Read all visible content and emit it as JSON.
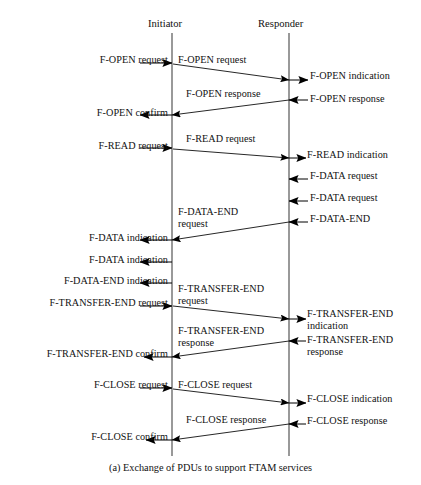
{
  "figure": {
    "caption": "(a) Exchange of PDUs to support FTAM services",
    "ink_color": "#000000",
    "background": "#ffffff"
  },
  "columns": {
    "initiator": {
      "label": "Initiator",
      "x": 172
    },
    "responder": {
      "label": "Responder",
      "x": 289
    }
  },
  "service_primitives": {
    "left": [
      {
        "id": "f-open-request",
        "text": "F-OPEN request",
        "x_right": 168,
        "y": 60
      },
      {
        "id": "f-open-confirm",
        "text": "F-OPEN confirm",
        "x_right": 168,
        "y": 113
      },
      {
        "id": "f-read-request",
        "text": "F-READ request",
        "x_right": 168,
        "y": 146
      },
      {
        "id": "f-data-indication-1",
        "text": "F-DATA indication",
        "x_right": 168,
        "y": 238
      },
      {
        "id": "f-data-indication-2",
        "text": "F-DATA indication",
        "x_right": 168,
        "y": 260
      },
      {
        "id": "f-data-end-indication",
        "text": "F-DATA-END indication",
        "x_right": 168,
        "y": 281
      },
      {
        "id": "f-transfer-end-request",
        "text": "F-TRANSFER-END request",
        "x_right": 168,
        "y": 303
      },
      {
        "id": "f-transfer-end-confirm",
        "text": "F-TRANSFER-END confirm",
        "x_right": 168,
        "y": 354
      },
      {
        "id": "f-close-request",
        "text": "F-CLOSE request",
        "x_right": 168,
        "y": 385
      },
      {
        "id": "f-close-confirm",
        "text": "F-CLOSE confirm",
        "x_right": 168,
        "y": 437
      }
    ],
    "right": [
      {
        "id": "f-open-indication",
        "text": "F-OPEN indication",
        "x_left": 310,
        "y": 76
      },
      {
        "id": "f-open-response",
        "text": "F-OPEN response",
        "x_left": 310,
        "y": 99
      },
      {
        "id": "f-read-indication",
        "text": "F-READ indication",
        "x_left": 307,
        "y": 155
      },
      {
        "id": "f-data-request-1",
        "text": "F-DATA request",
        "x_left": 310,
        "y": 176
      },
      {
        "id": "f-data-request-2",
        "text": "F-DATA request",
        "x_left": 310,
        "y": 198
      },
      {
        "id": "f-data-end",
        "text": "F-DATA-END",
        "x_left": 310,
        "y": 219
      },
      {
        "id": "f-transfer-end-indication",
        "text": "F-TRANSFER-END",
        "x_left": 307,
        "y": 314,
        "second_line": "indication"
      },
      {
        "id": "f-transfer-end-response",
        "text": "F-TRANSFER-END",
        "x_left": 307,
        "y": 340,
        "second_line": "response"
      },
      {
        "id": "f-close-indication",
        "text": "F-CLOSE indication",
        "x_left": 307,
        "y": 399
      },
      {
        "id": "f-close-response",
        "text": "F-CLOSE response",
        "x_left": 307,
        "y": 421
      }
    ]
  },
  "pdus": [
    {
      "id": "pdu-f-open-request",
      "text": "F-OPEN request",
      "x": 178,
      "y": 60
    },
    {
      "id": "pdu-f-open-response",
      "text": "F-OPEN response",
      "x": 186,
      "y": 94
    },
    {
      "id": "pdu-f-read-request",
      "text": "F-READ request",
      "x": 186,
      "y": 139
    },
    {
      "id": "pdu-f-data-end-request",
      "text": "F-DATA-END",
      "x": 178,
      "y": 212,
      "second_line": "request"
    },
    {
      "id": "pdu-f-transfer-end-request",
      "text": "F-TRANSFER-END",
      "x": 178,
      "y": 289,
      "second_line": "request"
    },
    {
      "id": "pdu-f-transfer-end-response",
      "text": "F-TRANSFER-END",
      "x": 178,
      "y": 331,
      "second_line": "response"
    },
    {
      "id": "pdu-f-close-request",
      "text": "F-CLOSE request",
      "x": 178,
      "y": 385
    },
    {
      "id": "pdu-f-close-response",
      "text": "F-CLOSE response",
      "x": 186,
      "y": 420
    }
  ],
  "arrows": {
    "description": "Message flow arrows between service users and the two protocol entity lifelines.",
    "items": [
      {
        "id": "arrow-f-open-request-in",
        "kind": "stub-right",
        "x1": 140,
        "y1": 63,
        "x2": 172,
        "y2": 63
      },
      {
        "id": "arrow-f-open-request-pdu",
        "kind": "diagonal-right",
        "x1": 173,
        "y1": 64,
        "x2": 289,
        "y2": 80
      },
      {
        "id": "arrow-f-open-indication-out",
        "kind": "stub-right",
        "x1": 289,
        "y1": 80,
        "x2": 308,
        "y2": 80
      },
      {
        "id": "arrow-f-open-response-in",
        "kind": "stub-left",
        "x1": 308,
        "y1": 100,
        "x2": 289,
        "y2": 100
      },
      {
        "id": "arrow-f-open-response-pdu",
        "kind": "diagonal-left",
        "x1": 289,
        "y1": 100,
        "x2": 172,
        "y2": 115
      },
      {
        "id": "arrow-f-open-confirm-out",
        "kind": "stub-left",
        "x1": 172,
        "y1": 115,
        "x2": 140,
        "y2": 115
      },
      {
        "id": "arrow-f-read-request-in",
        "kind": "stub-right",
        "x1": 140,
        "y1": 148,
        "x2": 172,
        "y2": 148
      },
      {
        "id": "arrow-f-read-request-pdu",
        "kind": "diagonal-right",
        "x1": 173,
        "y1": 149,
        "x2": 289,
        "y2": 158
      },
      {
        "id": "arrow-f-read-indication-out",
        "kind": "stub-right",
        "x1": 289,
        "y1": 158,
        "x2": 306,
        "y2": 158
      },
      {
        "id": "arrow-f-data-request-1-in",
        "kind": "stub-left",
        "x1": 308,
        "y1": 179,
        "x2": 289,
        "y2": 179
      },
      {
        "id": "arrow-f-data-request-2-in",
        "kind": "stub-left",
        "x1": 308,
        "y1": 201,
        "x2": 289,
        "y2": 201
      },
      {
        "id": "arrow-f-data-end-in",
        "kind": "stub-left",
        "x1": 308,
        "y1": 222,
        "x2": 289,
        "y2": 222
      },
      {
        "id": "arrow-f-data-end-pdu",
        "kind": "diagonal-left",
        "x1": 289,
        "y1": 222,
        "x2": 172,
        "y2": 240
      },
      {
        "id": "arrow-f-data-indication-1-out",
        "kind": "stub-left",
        "x1": 172,
        "y1": 240,
        "x2": 140,
        "y2": 240
      },
      {
        "id": "arrow-f-data-indication-2-out",
        "kind": "stub-left",
        "x1": 172,
        "y1": 262,
        "x2": 140,
        "y2": 262
      },
      {
        "id": "arrow-f-data-end-indication-out",
        "kind": "stub-left",
        "x1": 172,
        "y1": 283,
        "x2": 140,
        "y2": 283
      },
      {
        "id": "arrow-f-transfer-end-request-in",
        "kind": "stub-right",
        "x1": 140,
        "y1": 306,
        "x2": 172,
        "y2": 306
      },
      {
        "id": "arrow-f-transfer-end-request-pdu",
        "kind": "diagonal-right",
        "x1": 173,
        "y1": 306,
        "x2": 289,
        "y2": 319
      },
      {
        "id": "arrow-f-transfer-end-indication-out",
        "kind": "stub-right",
        "x1": 289,
        "y1": 319,
        "x2": 306,
        "y2": 319
      },
      {
        "id": "arrow-f-transfer-end-response-in",
        "kind": "stub-left",
        "x1": 306,
        "y1": 341,
        "x2": 289,
        "y2": 341
      },
      {
        "id": "arrow-f-transfer-end-response-pdu",
        "kind": "diagonal-left",
        "x1": 289,
        "y1": 341,
        "x2": 172,
        "y2": 357
      },
      {
        "id": "arrow-f-transfer-end-confirm-out",
        "kind": "stub-left",
        "x1": 172,
        "y1": 357,
        "x2": 144,
        "y2": 357
      },
      {
        "id": "arrow-f-close-request-in",
        "kind": "stub-right",
        "x1": 140,
        "y1": 388,
        "x2": 172,
        "y2": 388
      },
      {
        "id": "arrow-f-close-request-pdu",
        "kind": "diagonal-right",
        "x1": 173,
        "y1": 389,
        "x2": 289,
        "y2": 403
      },
      {
        "id": "arrow-f-close-indication-out",
        "kind": "stub-right",
        "x1": 289,
        "y1": 403,
        "x2": 306,
        "y2": 403
      },
      {
        "id": "arrow-f-close-response-in",
        "kind": "stub-left",
        "x1": 306,
        "y1": 424,
        "x2": 289,
        "y2": 424
      },
      {
        "id": "arrow-f-close-response-pdu",
        "kind": "diagonal-left",
        "x1": 289,
        "y1": 424,
        "x2": 172,
        "y2": 440
      },
      {
        "id": "arrow-f-close-confirm-out",
        "kind": "stub-left",
        "x1": 172,
        "y1": 440,
        "x2": 146,
        "y2": 440
      }
    ]
  },
  "lifelines": {
    "top_y": 33,
    "bottom_y": 456
  }
}
